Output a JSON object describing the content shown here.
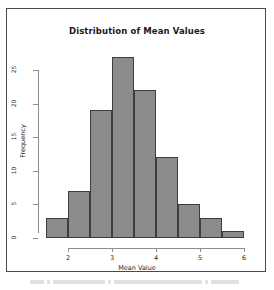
{
  "chart_data": {
    "type": "bar",
    "title": "Distribution of Mean Values",
    "xlabel": "Mean Value",
    "ylabel": "Frequency",
    "categories": [
      "1.5-2.0",
      "2.0-2.5",
      "2.5-3.0",
      "3.0-3.5",
      "3.5-4.0",
      "4.0-4.5",
      "4.5-5.0",
      "5.0-5.5",
      "5.5-6.0"
    ],
    "bin_edges": [
      1.5,
      2.0,
      2.5,
      3.0,
      3.5,
      4.0,
      4.5,
      5.0,
      5.5,
      6.0
    ],
    "bin_width": 0.5,
    "values": [
      3,
      7,
      19,
      27,
      22,
      12,
      5,
      3,
      1
    ],
    "xlim": [
      1.5,
      6.0
    ],
    "ylim": [
      0,
      27
    ],
    "x_ticks": [
      2,
      3,
      4,
      5,
      6
    ],
    "y_ticks": [
      0,
      5,
      10,
      15,
      20,
      25
    ],
    "grid": false,
    "legend": false,
    "bar_fill_color": "#8c8c8c",
    "bar_border_color": "#3d3d3d",
    "axis_color": "#8e8e8e",
    "background_color": "#ffffff",
    "frame_color": "#4a4a4a"
  },
  "figure": {
    "title": "Distribution of Mean Values",
    "x_axis_title": "Mean Value",
    "y_axis_title": "Frequency",
    "x_tick_labels": [
      "2",
      "3",
      "4",
      "5",
      "6"
    ],
    "y_tick_labels": [
      "0",
      "5",
      "10",
      "15",
      "20",
      "25"
    ]
  }
}
